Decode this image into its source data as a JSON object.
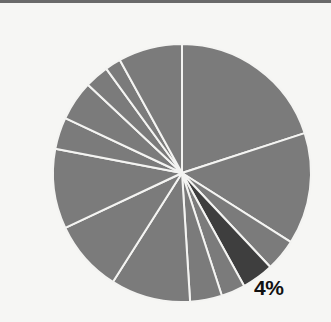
{
  "chart_data": {
    "type": "pie",
    "title": "",
    "start_angle_deg": 0,
    "direction": "clockwise",
    "values": [
      20,
      14,
      4,
      4,
      3,
      4,
      10,
      9,
      10,
      4,
      5,
      3,
      2,
      8
    ],
    "highlight_index": 3,
    "labels": [
      "",
      "",
      "",
      "4%",
      "",
      "",
      "",
      "",
      "",
      "",
      "",
      "",
      "",
      ""
    ],
    "colors": {
      "default": "#7b7b7b",
      "highlight": "#3e3e3e",
      "separator": "#f4f4f2",
      "background": "#f6f6f4"
    },
    "legend": null,
    "annotation": "4%"
  }
}
